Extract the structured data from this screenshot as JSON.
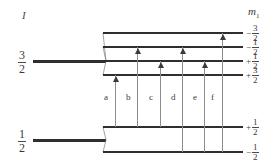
{
  "figure": {
    "type": "energy-level-diagram",
    "left_axis_label": "I",
    "right_axis_label": "m",
    "right_axis_sub": "1"
  },
  "left_states": [
    {
      "name": "I-three-halves",
      "num": "3",
      "den": "2",
      "y": 61
    },
    {
      "name": "I-one-half",
      "num": "1",
      "den": "2",
      "y": 140
    }
  ],
  "upper_manifold": {
    "name": "I-3/2 manifold",
    "levels": [
      {
        "sign": "−",
        "num": "3",
        "den": "2",
        "y": 33
      },
      {
        "sign": "−",
        "num": "1",
        "den": "2",
        "y": 47
      },
      {
        "sign": "+",
        "num": "1",
        "den": "2",
        "y": 61
      },
      {
        "sign": "+",
        "num": "3",
        "den": "2",
        "y": 75
      }
    ]
  },
  "lower_manifold": {
    "name": "I-1/2 manifold",
    "levels": [
      {
        "sign": "+",
        "num": "1",
        "den": "2",
        "y": 127
      },
      {
        "sign": "−",
        "num": "1",
        "den": "2",
        "y": 152
      }
    ]
  },
  "transitions": [
    {
      "label": "a",
      "x": 115,
      "from_y": 127,
      "to_y": 75,
      "label_y": 92
    },
    {
      "label": "b",
      "x": 137,
      "from_y": 127,
      "to_y": 47,
      "label_y": 92
    },
    {
      "label": "c",
      "x": 160,
      "from_y": 127,
      "to_y": 61,
      "label_y": 92
    },
    {
      "label": "d",
      "x": 182,
      "from_y": 152,
      "to_y": 47,
      "label_y": 92
    },
    {
      "label": "e",
      "x": 204,
      "from_y": 152,
      "to_y": 61,
      "label_y": 92
    },
    {
      "label": "f",
      "x": 222,
      "from_y": 152,
      "to_y": 33,
      "label_y": 92
    }
  ],
  "colors": {
    "level_line": "#2e2e2e",
    "transition_line": "#8d8d8d",
    "text": "#3a3a3a",
    "background": "#ffffff"
  }
}
